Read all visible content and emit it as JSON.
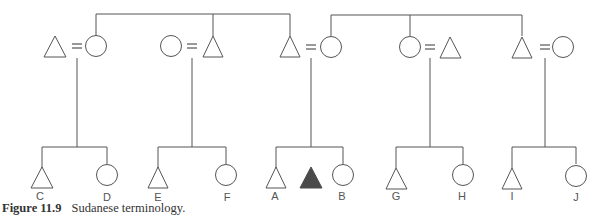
{
  "caption": {
    "figure_label": "Figure 11.9",
    "title": "Sudanese terminology."
  },
  "symbols": {
    "male": "triangle",
    "female": "circle",
    "ego": "filled-triangle",
    "marriage": "="
  },
  "colors": {
    "line": "#555555",
    "ego_fill": "#4a4a4a"
  },
  "labels": {
    "C": "C",
    "D": "D",
    "E": "E",
    "F": "F",
    "A": "A",
    "B": "B",
    "G": "G",
    "H": "H",
    "I": "I",
    "J": "J"
  },
  "couples": [
    {
      "left": "male",
      "right": "female",
      "children": [
        "C",
        "D"
      ]
    },
    {
      "left": "female",
      "right": "male",
      "children": [
        "E",
        "F"
      ]
    },
    {
      "left": "male",
      "right": "female",
      "children": [
        "A",
        "Ego",
        "B"
      ]
    },
    {
      "left": "female",
      "right": "male",
      "children": [
        "G",
        "H"
      ]
    },
    {
      "left": "male",
      "right": "female",
      "children": [
        "I",
        "J"
      ]
    }
  ]
}
